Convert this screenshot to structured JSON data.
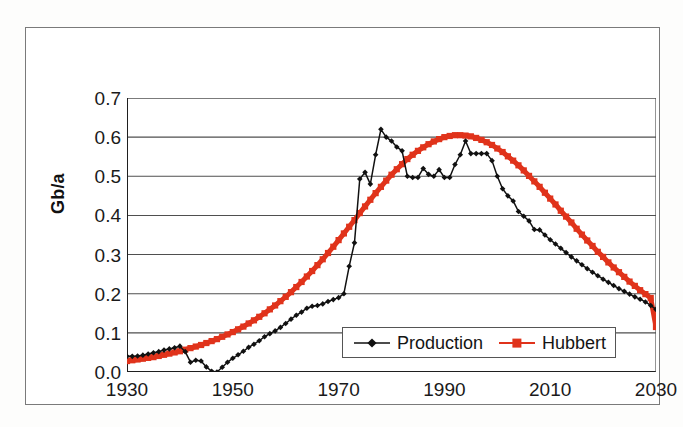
{
  "figure": {
    "background_color": "#ffffff",
    "frame_color": "#7a7a7a"
  },
  "axes": {
    "y_title": "Gb/a",
    "y_ticks": [
      "0.0",
      "0.1",
      "0.2",
      "0.3",
      "0.4",
      "0.5",
      "0.6",
      "0.7"
    ],
    "x_ticks": [
      "1930",
      "1950",
      "1970",
      "1990",
      "2010",
      "2030"
    ]
  },
  "legend": {
    "items": [
      {
        "label": "Production",
        "color": "#111111",
        "marker": "diamond"
      },
      {
        "label": "Hubbert",
        "color": "#e0331b",
        "marker": "square"
      }
    ]
  },
  "chart_data": {
    "type": "line",
    "title": "",
    "xlabel": "",
    "ylabel": "Gb/a",
    "xlim": [
      1930,
      2030
    ],
    "ylim": [
      0.0,
      0.7
    ],
    "ytick_values": [
      0.0,
      0.1,
      0.2,
      0.3,
      0.4,
      0.5,
      0.6,
      0.7
    ],
    "xtick_values": [
      1930,
      1950,
      1970,
      1990,
      2010,
      2030
    ],
    "grid": "horizontal",
    "legend_position": "inside-bottom-center",
    "x": [
      1930,
      1931,
      1932,
      1933,
      1934,
      1935,
      1936,
      1937,
      1938,
      1939,
      1940,
      1941,
      1942,
      1943,
      1944,
      1945,
      1946,
      1947,
      1948,
      1949,
      1950,
      1951,
      1952,
      1953,
      1954,
      1955,
      1956,
      1957,
      1958,
      1959,
      1960,
      1961,
      1962,
      1963,
      1964,
      1965,
      1966,
      1967,
      1968,
      1969,
      1970,
      1971,
      1972,
      1973,
      1974,
      1975,
      1976,
      1977,
      1978,
      1979,
      1980,
      1981,
      1982,
      1983,
      1984,
      1985,
      1986,
      1987,
      1988,
      1989,
      1990,
      1991,
      1992,
      1993,
      1994,
      1995,
      1996,
      1997,
      1998,
      1999,
      2000,
      2001,
      2002,
      2003,
      2004,
      2005,
      2006,
      2007,
      2008,
      2009,
      2010,
      2011,
      2012,
      2013,
      2014,
      2015,
      2016,
      2017,
      2018,
      2019,
      2020,
      2021,
      2022,
      2023,
      2024,
      2025,
      2026,
      2027,
      2028,
      2029,
      2030
    ],
    "series": [
      {
        "name": "Production",
        "color": "#111111",
        "marker": "diamond",
        "values": [
          0.04,
          0.04,
          0.041,
          0.043,
          0.046,
          0.049,
          0.052,
          0.056,
          0.059,
          0.062,
          0.066,
          0.052,
          0.025,
          0.03,
          0.028,
          0.013,
          0.002,
          0.0,
          0.012,
          0.025,
          0.035,
          0.044,
          0.053,
          0.063,
          0.071,
          0.08,
          0.09,
          0.098,
          0.105,
          0.114,
          0.124,
          0.135,
          0.145,
          0.153,
          0.163,
          0.168,
          0.17,
          0.174,
          0.18,
          0.185,
          0.19,
          0.2,
          0.27,
          0.33,
          0.493,
          0.51,
          0.48,
          0.555,
          0.62,
          0.6,
          0.59,
          0.575,
          0.565,
          0.5,
          0.497,
          0.497,
          0.52,
          0.505,
          0.5,
          0.517,
          0.497,
          0.497,
          0.53,
          0.555,
          0.59,
          0.558,
          0.558,
          0.558,
          0.558,
          0.54,
          0.5,
          0.468,
          0.45,
          0.437,
          0.41,
          0.398,
          0.386,
          0.364,
          0.363,
          0.35,
          0.338,
          0.327,
          0.316,
          0.305,
          0.294,
          0.284,
          0.274,
          0.264,
          0.255,
          0.246,
          0.237,
          0.229,
          0.221,
          0.213,
          0.206,
          0.199,
          0.192,
          0.186,
          0.179,
          0.17,
          0.16
        ]
      },
      {
        "name": "Hubbert",
        "color": "#e0331b",
        "marker": "square",
        "values": [
          0.028,
          0.03,
          0.032,
          0.034,
          0.036,
          0.038,
          0.041,
          0.044,
          0.047,
          0.05,
          0.053,
          0.057,
          0.061,
          0.065,
          0.069,
          0.074,
          0.079,
          0.084,
          0.09,
          0.096,
          0.102,
          0.109,
          0.116,
          0.124,
          0.132,
          0.141,
          0.15,
          0.16,
          0.17,
          0.181,
          0.192,
          0.204,
          0.217,
          0.23,
          0.244,
          0.258,
          0.273,
          0.288,
          0.304,
          0.32,
          0.337,
          0.354,
          0.371,
          0.388,
          0.406,
          0.423,
          0.44,
          0.457,
          0.473,
          0.489,
          0.504,
          0.518,
          0.531,
          0.544,
          0.555,
          0.565,
          0.574,
          0.582,
          0.589,
          0.595,
          0.6,
          0.603,
          0.605,
          0.605,
          0.604,
          0.602,
          0.598,
          0.593,
          0.587,
          0.58,
          0.571,
          0.562,
          0.551,
          0.54,
          0.528,
          0.515,
          0.501,
          0.487,
          0.473,
          0.458,
          0.443,
          0.428,
          0.412,
          0.397,
          0.382,
          0.366,
          0.351,
          0.336,
          0.322,
          0.307,
          0.294,
          0.28,
          0.267,
          0.255,
          0.243,
          0.231,
          0.22,
          0.209,
          0.199,
          0.189,
          0.115
        ]
      }
    ]
  }
}
